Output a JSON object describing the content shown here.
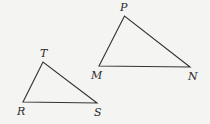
{
  "diagram": {
    "type": "geometry",
    "stroke_color": "#333333",
    "background": "#f4f4f2",
    "triangles": [
      {
        "name": "MNP",
        "vertices": [
          {
            "label": "P",
            "x": 124.5,
            "y": 16,
            "label_x": 120,
            "label_y": 2
          },
          {
            "label": "M",
            "x": 99,
            "y": 66,
            "label_x": 91,
            "label_y": 70
          },
          {
            "label": "N",
            "x": 190,
            "y": 67,
            "label_x": 188,
            "label_y": 71
          }
        ]
      },
      {
        "name": "RST",
        "vertices": [
          {
            "label": "T",
            "x": 43,
            "y": 62,
            "label_x": 40,
            "label_y": 48
          },
          {
            "label": "R",
            "x": 23,
            "y": 102,
            "label_x": 17,
            "label_y": 106
          },
          {
            "label": "S",
            "x": 97,
            "y": 103,
            "label_x": 94,
            "label_y": 107
          }
        ]
      }
    ]
  }
}
